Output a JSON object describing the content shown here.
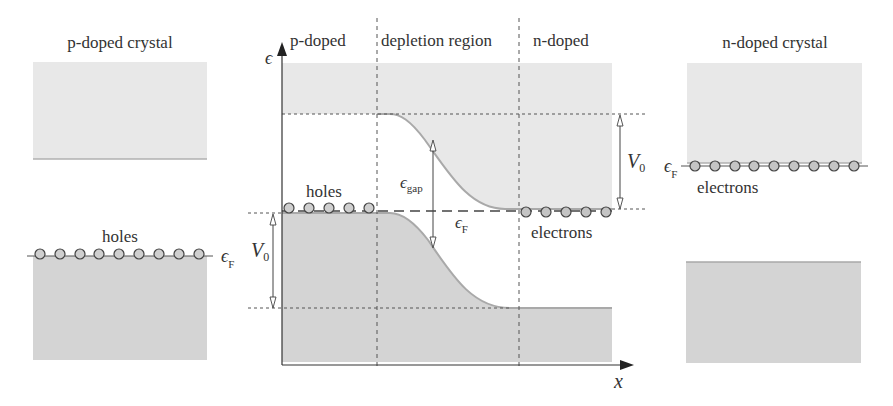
{
  "colors": {
    "conduction_band": "#e8e8e8",
    "valence_band": "#d4d4d4",
    "band_edge": "#a9a9a9",
    "particle_fill": "#c9c9c9",
    "line": "#444444",
    "text": "#333333"
  },
  "left_crystal": {
    "title": "p-doped crystal",
    "carrier_label": "holes",
    "fermi_label": "ϵ",
    "fermi_sub": "F",
    "carrier_count": 9
  },
  "right_crystal": {
    "title": "n-doped crystal",
    "carrier_label": "electrons",
    "fermi_label": "ϵ",
    "fermi_sub": "F",
    "carrier_count": 9
  },
  "junction": {
    "region_labels": {
      "p": "p-doped",
      "depletion": "depletion region",
      "n": "n-doped"
    },
    "y_axis_label": "ϵ",
    "x_axis_label": "x",
    "holes_label": "holes",
    "electrons_label": "electrons",
    "gap_label": "ϵ",
    "gap_sub": "gap",
    "fermi_label": "ϵ",
    "fermi_sub": "F",
    "v0_left": "V",
    "v0_left_sub": "0",
    "v0_right": "V",
    "v0_right_sub": "0",
    "hole_count": 5,
    "electron_count": 5
  }
}
